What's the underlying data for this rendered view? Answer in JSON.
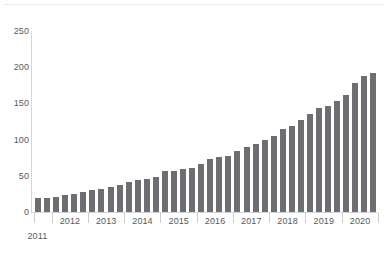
{
  "chart_data": {
    "type": "bar",
    "title": "",
    "subtitle": "",
    "xlabel": "",
    "ylabel": "",
    "ylim": [
      0,
      250
    ],
    "yticks": [
      0,
      50,
      100,
      150,
      200,
      250
    ],
    "grid": false,
    "legend": null,
    "bar_color": "#6d6e71",
    "axis_color": "#d4d6d8",
    "label_color": "#58595b",
    "group_labels": [
      "2011",
      "2012",
      "2013",
      "2014",
      "2015",
      "2016",
      "2017",
      "2018",
      "2019",
      "2020"
    ],
    "group_sizes": [
      2,
      4,
      4,
      4,
      4,
      4,
      4,
      4,
      4,
      4
    ],
    "categories": [
      "2011 Q3",
      "2011 Q4",
      "2012 Q1",
      "2012 Q2",
      "2012 Q3",
      "2012 Q4",
      "2013 Q1",
      "2013 Q2",
      "2013 Q3",
      "2013 Q4",
      "2014 Q1",
      "2014 Q2",
      "2014 Q3",
      "2014 Q4",
      "2015 Q1",
      "2015 Q2",
      "2015 Q3",
      "2015 Q4",
      "2016 Q1",
      "2016 Q2",
      "2016 Q3",
      "2016 Q4",
      "2017 Q1",
      "2017 Q2",
      "2017 Q3",
      "2017 Q4",
      "2018 Q1",
      "2018 Q2",
      "2018 Q3",
      "2018 Q4",
      "2019 Q1",
      "2019 Q2",
      "2019 Q3",
      "2019 Q4",
      "2020 Q1",
      "2020 Q2",
      "2020 Q3",
      "2020 Q4"
    ],
    "values": [
      19,
      19,
      21,
      23,
      25,
      27,
      30,
      32,
      34,
      37,
      42,
      44,
      46,
      49,
      56,
      57,
      59,
      61,
      66,
      73,
      76,
      78,
      84,
      90,
      94,
      99,
      105,
      114,
      119,
      127,
      136,
      144,
      147,
      154,
      162,
      178,
      188,
      192
    ]
  }
}
